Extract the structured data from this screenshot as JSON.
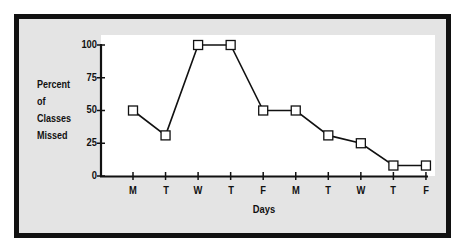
{
  "chart_data": {
    "type": "line",
    "title": "",
    "xlabel": "Days",
    "ylabel": "Percent of Classes Missed",
    "ylabel_lines": [
      "Percent",
      "of",
      "Classes",
      "Missed"
    ],
    "categories": [
      "M",
      "T",
      "W",
      "T",
      "F",
      "M",
      "T",
      "W",
      "T",
      "F"
    ],
    "series": [
      {
        "name": "Percent of Classes Missed",
        "values": [
          50,
          31,
          100,
          100,
          50,
          50,
          31,
          25,
          8,
          8
        ],
        "marker": "open-square",
        "color": "#111111"
      }
    ],
    "yticks": [
      "0",
      "25",
      "50",
      "75",
      "100"
    ],
    "ylim": [
      0,
      100
    ],
    "grid": false,
    "legend": null
  },
  "colors": {
    "frame": "#111111",
    "panel": "#e4e4e4",
    "plot": "#ffffff",
    "line": "#111111"
  }
}
